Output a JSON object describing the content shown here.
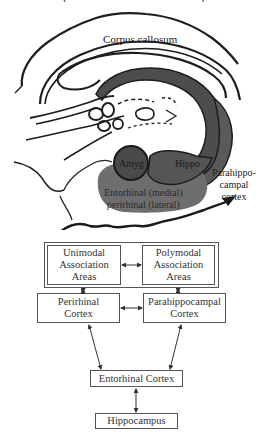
{
  "illustration": {
    "labels": {
      "corpus_callosum": "Corpus callosum",
      "amygdala": "Amyg",
      "hippocampus": "Hippo",
      "parahippocampal": "Parahippo-\ncampal\ncortex",
      "entorhinal_perirhinal": "Entorhinal (medial)\nperirhinal (lateral)"
    },
    "colors": {
      "outline": "#1e1e1e",
      "hippo_fill": "#555555",
      "amyg_fill": "#4a4a4a",
      "cortex_fill": "#6e6e6e",
      "background": "#ffffff"
    }
  },
  "flowchart": {
    "nodes": [
      {
        "id": "unimodal",
        "label": "Unimodal\nAssociation\nAreas"
      },
      {
        "id": "polymodal",
        "label": "Polymodal\nAssociation\nAreas"
      },
      {
        "id": "perirhinal",
        "label": "Perirhinal\nCortex"
      },
      {
        "id": "parahippocampal",
        "label": "Parahippocampal\nCortex"
      },
      {
        "id": "entorhinal",
        "label": "Entorhinal Cortex"
      },
      {
        "id": "hippocampus",
        "label": "Hippocampus"
      }
    ],
    "edges": [
      {
        "from": "unimodal",
        "to": "polymodal",
        "bidirectional": true
      },
      {
        "from": "unimodal",
        "to": "perirhinal",
        "bidirectional": true
      },
      {
        "from": "polymodal",
        "to": "parahippocampal",
        "bidirectional": true
      },
      {
        "from": "perirhinal",
        "to": "parahippocampal",
        "bidirectional": true
      },
      {
        "from": "perirhinal",
        "to": "entorhinal",
        "bidirectional": true
      },
      {
        "from": "parahippocampal",
        "to": "entorhinal",
        "bidirectional": true
      },
      {
        "from": "entorhinal",
        "to": "hippocampus",
        "bidirectional": true
      }
    ]
  }
}
